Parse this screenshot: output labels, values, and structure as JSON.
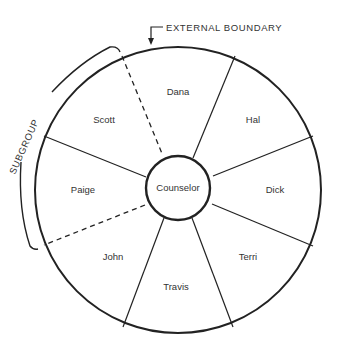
{
  "diagram": {
    "boundary_label": "EXTERNAL BOUNDARY",
    "subgroup_label": "SUBGROUP",
    "center_label": "Counselor",
    "members": [
      {
        "name": "Dana",
        "x": 178,
        "y": 95
      },
      {
        "name": "Hal",
        "x": 253,
        "y": 123
      },
      {
        "name": "Dick",
        "x": 275,
        "y": 193
      },
      {
        "name": "Terri",
        "x": 248,
        "y": 260
      },
      {
        "name": "Travis",
        "x": 176,
        "y": 290
      },
      {
        "name": "John",
        "x": 113,
        "y": 260
      },
      {
        "name": "Paige",
        "x": 83,
        "y": 193
      },
      {
        "name": "Scott",
        "x": 104,
        "y": 123
      }
    ],
    "colors": {
      "line": "#222222",
      "text": "#333333",
      "background": "#ffffff"
    }
  }
}
